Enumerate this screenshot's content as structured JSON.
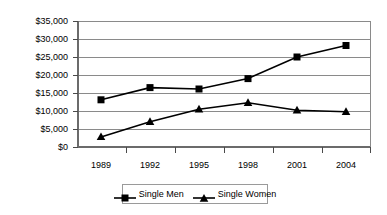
{
  "chart_data": {
    "type": "line",
    "title": "",
    "subtitle": "",
    "xlabel": "",
    "ylabel": "",
    "categories": [
      "1989",
      "1992",
      "1995",
      "1998",
      "2001",
      "2004"
    ],
    "series": [
      {
        "name": "Single Men",
        "marker": "square",
        "color": "#000000",
        "values": [
          13100,
          16500,
          16100,
          19000,
          25000,
          28200
        ]
      },
      {
        "name": "Single Women",
        "marker": "triangle",
        "color": "#000000",
        "values": [
          2800,
          7000,
          10500,
          12300,
          10200,
          9800
        ]
      }
    ],
    "ylim": [
      0,
      35000
    ],
    "ytick_values": [
      0,
      5000,
      10000,
      15000,
      20000,
      25000,
      30000,
      35000
    ],
    "ytick_labels": [
      "$0",
      "$5,000",
      "$10,000",
      "$15,000",
      "$20,000",
      "$25,000",
      "$30,000",
      "$35,000"
    ],
    "grid": true,
    "grid_axis": "y",
    "grid_color": "#808080",
    "plot_border_color": "#808080",
    "legend_position": "bottom",
    "legend_entries": [
      "Single Men",
      "Single Women"
    ]
  }
}
